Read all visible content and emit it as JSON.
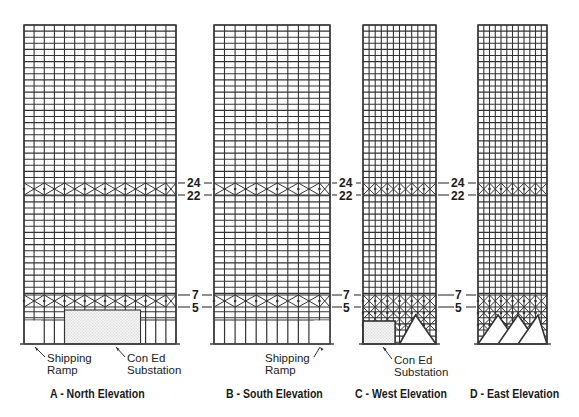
{
  "figure": {
    "line_color": "#333333",
    "ground_color": "#444444",
    "fill_dots_color": "#bdbdbd"
  },
  "floor_labels": [
    "24",
    "22",
    "7",
    "5"
  ],
  "elevations": [
    {
      "id": "A",
      "caption": "A - North Elevation",
      "x": 24,
      "width": 152,
      "cols": 15,
      "annotations": [
        {
          "text_lines": [
            "Shipping",
            "Ramp"
          ],
          "x": 47,
          "y": 352
        },
        {
          "text_lines": [
            "Con Ed",
            "Substation"
          ],
          "x": 127,
          "y": 352
        }
      ]
    },
    {
      "id": "B",
      "caption": "B - South Elevation",
      "x": 214,
      "width": 116,
      "cols": 11,
      "annotations": [
        {
          "text_lines": [
            "Shipping",
            "Ramp"
          ],
          "x": 265,
          "y": 352
        }
      ]
    },
    {
      "id": "C",
      "caption": "C - West Elevation",
      "x": 363,
      "width": 73,
      "cols": 12,
      "annotations": [
        {
          "text_lines": [
            "Con Ed",
            "Substation"
          ],
          "x": 394,
          "y": 354
        }
      ]
    },
    {
      "id": "D",
      "caption": "D - East Elevation",
      "x": 478,
      "width": 69,
      "cols": 12,
      "annotations": []
    }
  ],
  "levels": {
    "top_y": 25,
    "ground_y": 344,
    "floor24_y": 183,
    "floor22_y": 195,
    "floor7_y": 295,
    "floor5_y": 307
  }
}
